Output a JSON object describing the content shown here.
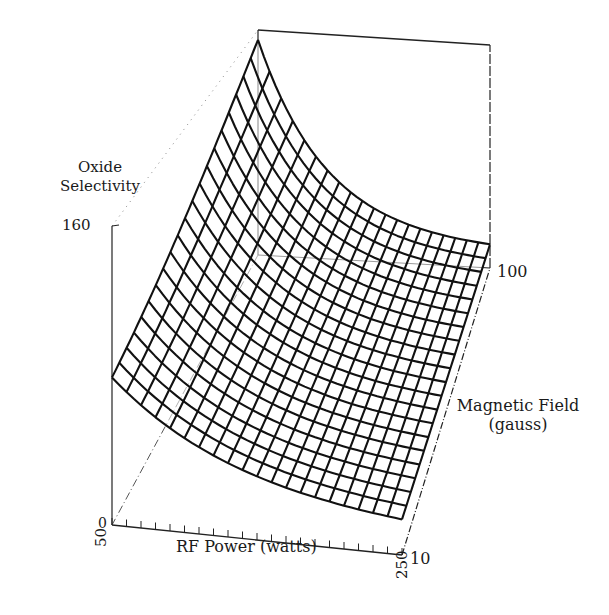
{
  "chart_data": {
    "type": "surface3d",
    "title": "",
    "xlabel": "RF Power (watts)",
    "ylabel": "Magnetic Field (gauss)",
    "zlabel": "Oxide Selectivity",
    "x_range": [
      50,
      250
    ],
    "y_range": [
      10,
      100
    ],
    "z_range": [
      0,
      160
    ],
    "x_tick_labels": [
      "50",
      "250"
    ],
    "y_tick_labels": [
      "10",
      "100"
    ],
    "z_tick_labels": [
      "0",
      "160"
    ],
    "grid_lines_x": 20,
    "grid_lines_y": 20,
    "corner_values": {
      "rf50_mag10": 79,
      "rf250_mag10": 19,
      "rf50_mag100": 153,
      "rf250_mag100": 17
    },
    "surface_description": "Oxide selectivity is highest at low RF power and high magnetic field, decreasing roughly exponentially with increasing RF power"
  },
  "labels": {
    "zlabel_line1": "Oxide",
    "zlabel_line2": "Selectivity",
    "z_max": "160",
    "z_min": "0",
    "x_min": "50",
    "x_max": "250",
    "xlabel": "RF Power (watts)",
    "y_min": "10",
    "y_max": "100",
    "ylabel_line1": "Magnetic Field",
    "ylabel_line2": "(gauss)"
  },
  "colors": {
    "mesh": "#111111",
    "axes": "#222222",
    "background": "#ffffff"
  }
}
